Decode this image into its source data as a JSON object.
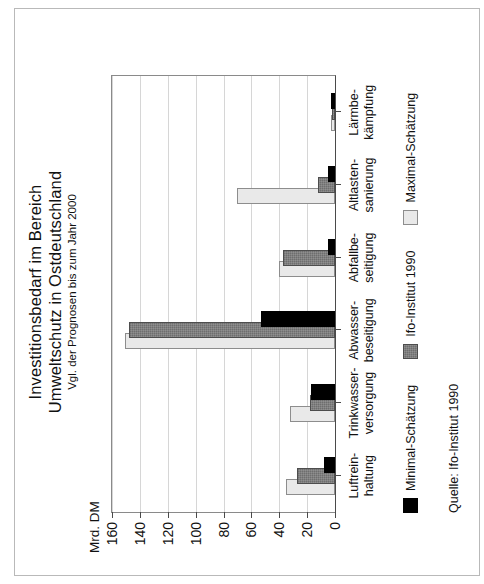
{
  "figure": {
    "caption_prefix": "Abbildung:",
    "caption_number": "3.2"
  },
  "chart_data": {
    "type": "bar",
    "orientation": "horizontal",
    "title": "Investitionsbedarf im Bereich Umweltschutz in Ostdeutschland",
    "title_line1": "Investitionsbedarf im Bereich",
    "title_line2": "Umweltschutz in Ostdeutschland",
    "subtitle": "Vgl. der Prognosen bis zum Jahr 2000",
    "xlabel": "",
    "ylabel": "Mrd. DM",
    "unit_label": "Mrd. DM",
    "ylim": [
      0,
      160
    ],
    "yticks": [
      160,
      140,
      120,
      100,
      80,
      60,
      40,
      20,
      0
    ],
    "ytick_labels": [
      "160",
      "140",
      "120",
      "100",
      "80",
      "60",
      "40",
      "20",
      "0"
    ],
    "grid": true,
    "legend_position": "bottom-left",
    "categories": [
      "Luftrein-\nhaltung",
      "Trinkwasser-\nversorgung",
      "Abwasser-\nbeseitigung",
      "Abfallbe-\nseitigung",
      "Altlasten-\nsanierung",
      "Lärmbe-\nkämpfung"
    ],
    "category_labels": [
      {
        "line1": "Luftrein-",
        "line2": "haltung"
      },
      {
        "line1": "Trinkwasser-",
        "line2": "versorgung"
      },
      {
        "line1": "Abwasser-",
        "line2": "beseitigung"
      },
      {
        "line1": "Abfallbe-",
        "line2": "seitigung"
      },
      {
        "line1": "Altlasten-",
        "line2": "sanierung"
      },
      {
        "line1": "Lärmbe-",
        "line2": "kämpfung"
      }
    ],
    "series": [
      {
        "name": "Minimal-Schätzung",
        "color": "#000000",
        "values": [
          8,
          17,
          53,
          5,
          5,
          3
        ]
      },
      {
        "name": "Ifo-Institut 1990",
        "color": "#6e6e6e",
        "values": [
          27,
          18,
          148,
          37,
          12,
          2
        ]
      },
      {
        "name": "Maximal-Schätzung",
        "color": "#e9e9e9",
        "values": [
          35,
          32,
          151,
          40,
          70,
          3
        ]
      }
    ]
  },
  "legend": {
    "items": [
      {
        "label": "Minimal-Schätzung",
        "swatch": "min"
      },
      {
        "label": "Ifo-Institut 1990",
        "swatch": "ifo"
      },
      {
        "label": "Maximal-Schätzung",
        "swatch": "max"
      }
    ]
  },
  "source": {
    "text": "Quelle: Ifo-Institut 1990"
  },
  "colors": {
    "minimal": "#000000",
    "ifo": "#6e6e6e",
    "maximal": "#e9e9e9",
    "axis": "#4a4a4a",
    "grid": "#d6d6d6",
    "frame": "#b9b9b9"
  }
}
